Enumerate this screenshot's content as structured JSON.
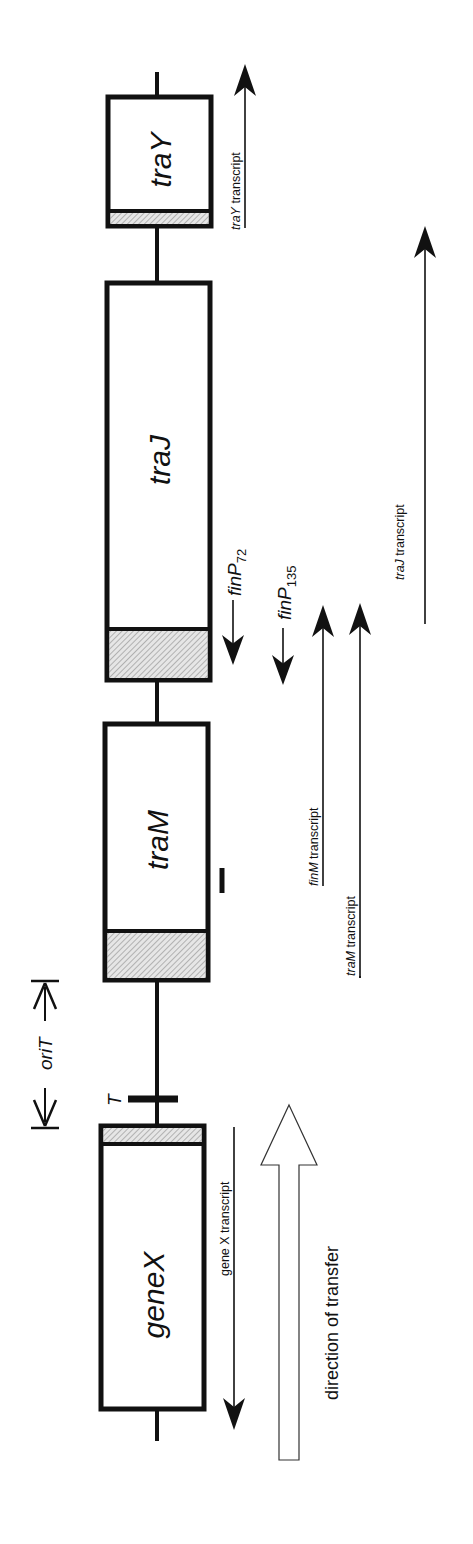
{
  "figure": {
    "orientation": "rotated 90 degrees; text reads bottom-to-top"
  },
  "colors": {
    "stroke": "#111111",
    "hatch": "#9a9a9a",
    "hatch_bg": "#e6e6e6",
    "background": "#ffffff"
  },
  "backbone": {
    "x": 157,
    "y_top": 72,
    "y_bottom": 1441
  },
  "genes": [
    {
      "id": "traY",
      "label_prefix": "tra",
      "label_suffix": "Y",
      "x": 108,
      "y_top": 97,
      "y_bottom": 226,
      "hatch_top": 211,
      "hatch_bottom": 224,
      "label_y": 160
    },
    {
      "id": "traJ",
      "label_prefix": "tra",
      "label_suffix": "J",
      "x": 107,
      "y_top": 283,
      "y_bottom": 680,
      "hatch_top": 629,
      "hatch_bottom": 678,
      "label_y": 460
    },
    {
      "id": "traM",
      "label_prefix": "tra",
      "label_suffix": "M",
      "x": 105,
      "y_top": 724,
      "y_bottom": 980,
      "hatch_top": 931,
      "hatch_bottom": 978,
      "label_y": 840
    },
    {
      "id": "geneX",
      "label_prefix": "gene",
      "label_suffix": "X",
      "x": 101,
      "y_top": 1126,
      "y_bottom": 1409,
      "hatch_top": 1128,
      "hatch_bottom": 1144,
      "label_y": 1295
    }
  ],
  "gene_box_width": 103,
  "terminator": {
    "label": "T",
    "bar_x1": 128,
    "bar_x2": 178,
    "y": 1099,
    "label_x": 117,
    "label_y": 1098
  },
  "small_mark": {
    "x": 222,
    "y1": 868,
    "y2": 893
  },
  "oriT": {
    "label": "oriT",
    "x": 45,
    "y_top": 981,
    "y_bottom": 1128,
    "label_y": 1050
  },
  "fin_promoters": [
    {
      "label": "finP",
      "subscript": "72",
      "x": 233,
      "arrow_top": 600,
      "arrow_tip": 665,
      "label_y": 600
    },
    {
      "label": "finP",
      "subscript": "135",
      "x": 283,
      "arrow_top": 628,
      "arrow_tip": 685,
      "label_y": 624
    }
  ],
  "transcripts": [
    {
      "id": "traY",
      "prefix": "traY",
      "suffix": " transcript",
      "x": 245,
      "y_start": 228,
      "y_end": 64,
      "direction": "up",
      "label_x": 240,
      "label_y": 230,
      "underline": false
    },
    {
      "id": "traJ",
      "prefix": "traJ",
      "suffix": "  transcript",
      "x": 425,
      "y_start": 624,
      "y_end": 226,
      "direction": "up",
      "label_x": 404,
      "label_y": 580,
      "underline": false
    },
    {
      "id": "finM",
      "prefix": "finM",
      "suffix": " transcript",
      "x": 323,
      "y_start": 800,
      "y_end": 605,
      "direction": "up",
      "label_x": 318,
      "label_y": 886,
      "underline": true
    },
    {
      "id": "traM",
      "prefix": "traM",
      "suffix": " transcript",
      "x": 360,
      "y_start": 978,
      "y_end": 603,
      "direction": "up",
      "label_x": 355,
      "label_y": 976,
      "underline": true
    },
    {
      "id": "geneX",
      "prefix": "gene X",
      "suffix": " transcript",
      "x": 234,
      "y_start": 1127,
      "y_end": 1430,
      "direction": "down",
      "label_x": 229,
      "label_y": 1276,
      "underline": false
    }
  ],
  "transfer_arrow": {
    "label": "direction of transfer",
    "x_center": 289,
    "shaft_half_width": 10,
    "head_half_width": 28,
    "tip_y": 1105,
    "head_base_y": 1165,
    "bottom_y": 1460,
    "label_x": 338,
    "label_y": 1400
  }
}
